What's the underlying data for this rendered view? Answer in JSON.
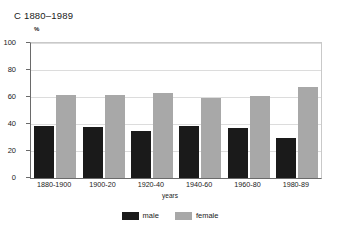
{
  "chart_data": {
    "type": "bar",
    "title": "C 1880–1989",
    "xlabel": "years",
    "ylabel": "",
    "unit_label": "%",
    "categories": [
      "1880-1900",
      "1900-20",
      "1920-40",
      "1940-60",
      "1960-80",
      "1980-89"
    ],
    "series": [
      {
        "name": "male",
        "color": "#1a1a1a",
        "values": [
          38.5,
          38,
          34.5,
          38.5,
          37,
          29.5
        ]
      },
      {
        "name": "female",
        "color": "#a8a8a8",
        "values": [
          61.5,
          61.5,
          63,
          59.5,
          61,
          67.5
        ]
      }
    ],
    "ylim": [
      0,
      100
    ],
    "yticks": [
      0,
      20,
      40,
      60,
      80,
      100
    ],
    "ytick_labels": [
      "0",
      "20",
      "40",
      "60",
      "80",
      "100"
    ],
    "grid": true,
    "legend_position": "bottom"
  }
}
